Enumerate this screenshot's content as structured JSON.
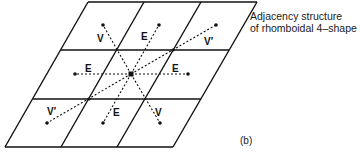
{
  "caption": {
    "line1": "Adjacency structure",
    "line2": "of rhomboidal 4–shape"
  },
  "panel_label": "(b)",
  "grid": {
    "rows": 3,
    "cols": 3,
    "shape": "rhombus"
  },
  "labels": {
    "top_left": "V",
    "top_mid": "E",
    "top_right": "V′",
    "mid_left": "E",
    "mid_right": "E",
    "bot_left": "V′",
    "bot_mid": "E",
    "bot_right": "V"
  }
}
